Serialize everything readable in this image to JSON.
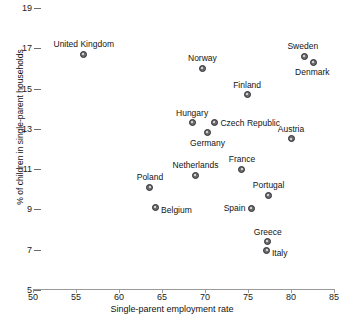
{
  "chart_data": {
    "type": "scatter",
    "title": "",
    "xlabel": "Single-parent employment rate",
    "ylabel": "% of children in single-parent households",
    "xlim": [
      50,
      85
    ],
    "ylim": [
      5,
      19
    ],
    "xticks": [
      50,
      55,
      60,
      65,
      70,
      75,
      80,
      85
    ],
    "yticks": [
      5,
      7,
      9,
      11,
      13,
      15,
      17,
      19
    ],
    "grid": false,
    "legend": "none",
    "points": [
      {
        "label": "United Kingdom",
        "x": 55.9,
        "y": 16.7,
        "label_pos": "above",
        "label_dx": 0,
        "label_dy": -5
      },
      {
        "label": "Sweden",
        "x": 81.6,
        "y": 16.6,
        "label_pos": "above",
        "label_dx": -2,
        "label_dy": -5
      },
      {
        "label": "Denmark",
        "x": 82.6,
        "y": 16.3,
        "label_pos": "below",
        "label_dx": -1,
        "label_dy": 5
      },
      {
        "label": "Norway",
        "x": 69.7,
        "y": 16.0,
        "label_pos": "above",
        "label_dx": 0,
        "label_dy": -5
      },
      {
        "label": "Finland",
        "x": 74.9,
        "y": 14.7,
        "label_pos": "above",
        "label_dx": 0,
        "label_dy": -5
      },
      {
        "label": "Hungary",
        "x": 68.5,
        "y": 13.3,
        "label_pos": "above",
        "label_dx": 0,
        "label_dy": -5
      },
      {
        "label": "Czech Republic",
        "x": 71.1,
        "y": 13.3,
        "label_pos": "right",
        "label_dx": 6,
        "label_dy": 0
      },
      {
        "label": "Germany",
        "x": 70.3,
        "y": 12.8,
        "label_pos": "below",
        "label_dx": 0,
        "label_dy": 5
      },
      {
        "label": "Austria",
        "x": 80.0,
        "y": 12.5,
        "label_pos": "above",
        "label_dx": 0,
        "label_dy": -5
      },
      {
        "label": "France",
        "x": 74.3,
        "y": 11.0,
        "label_pos": "above",
        "label_dx": 0,
        "label_dy": -5
      },
      {
        "label": "Netherlands",
        "x": 68.9,
        "y": 10.7,
        "label_pos": "above",
        "label_dx": 0,
        "label_dy": -5
      },
      {
        "label": "Portugal",
        "x": 77.4,
        "y": 9.7,
        "label_pos": "above",
        "label_dx": 0,
        "label_dy": -5
      },
      {
        "label": "Poland",
        "x": 63.6,
        "y": 10.1,
        "label_pos": "above",
        "label_dx": 0,
        "label_dy": -5
      },
      {
        "label": "Spain",
        "x": 75.4,
        "y": 9.05,
        "label_pos": "left",
        "label_dx": -6,
        "label_dy": 0
      },
      {
        "label": "Belgium",
        "x": 64.2,
        "y": 9.1,
        "label_pos": "right",
        "label_dx": 6,
        "label_dy": 3
      },
      {
        "label": "Greece",
        "x": 77.3,
        "y": 7.4,
        "label_pos": "above",
        "label_dx": 0,
        "label_dy": -5
      },
      {
        "label": "Italy",
        "x": 77.2,
        "y": 6.95,
        "label_pos": "right",
        "label_dx": 5,
        "label_dy": 2
      }
    ]
  }
}
